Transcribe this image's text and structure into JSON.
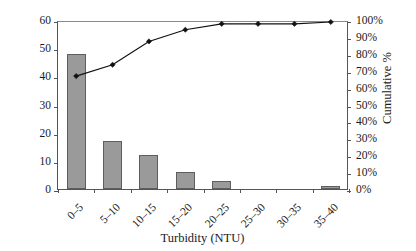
{
  "chart_data": {
    "type": "bar",
    "title": "",
    "subtitle": "",
    "xlabel": "Turbidity (NTU)",
    "ylabel": "Frequency",
    "y2label": "Cumulative %",
    "categories": [
      "0–5",
      "5–10",
      "10–15",
      "15–20",
      "20–25",
      "25–30",
      "30–35",
      "35–40"
    ],
    "series": [
      {
        "name": "Frequency",
        "type": "bar",
        "axis": "left",
        "values": [
          48,
          17,
          12,
          6,
          3,
          0,
          0,
          1
        ],
        "color": "#9a9a9a",
        "edge_color": "#5e5e5e"
      },
      {
        "name": "Cumulative %",
        "type": "line",
        "axis": "right",
        "values": [
          68,
          74.7,
          88.5,
          95.4,
          98.9,
          98.9,
          98.9,
          100
        ],
        "color": "#111111",
        "marker": "diamond"
      }
    ],
    "ylim": [
      0,
      60
    ],
    "yticks": [
      0,
      10,
      20,
      30,
      40,
      50,
      60
    ],
    "ytick_labels": [
      "0",
      "10",
      "20",
      "30",
      "40",
      "50",
      "60"
    ],
    "y2lim": [
      0,
      100
    ],
    "y2ticks": [
      0,
      10,
      20,
      30,
      40,
      50,
      60,
      70,
      80,
      90,
      100
    ],
    "y2tick_labels": [
      "0%",
      "10%",
      "20%",
      "30%",
      "40%",
      "50%",
      "60%",
      "70%",
      "80%",
      "90%",
      "100%"
    ],
    "grid": false,
    "legend": "none",
    "total_count": 87
  }
}
